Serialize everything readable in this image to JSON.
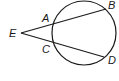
{
  "diagram": {
    "type": "geometry",
    "circle": {
      "cx": 84,
      "cy": 33,
      "r": 32
    },
    "points": {
      "E": {
        "label": "E",
        "x": 21,
        "y": 33,
        "label_x": 9,
        "label_y": 37
      },
      "A": {
        "label": "A",
        "x": 52,
        "y": 24,
        "label_x": 42,
        "label_y": 22
      },
      "B": {
        "label": "B",
        "x": 106,
        "y": 9,
        "label_x": 108,
        "label_y": 9
      },
      "C": {
        "label": "C",
        "x": 52,
        "y": 43,
        "label_x": 42,
        "label_y": 53
      },
      "D": {
        "label": "D",
        "x": 104,
        "y": 57,
        "label_x": 108,
        "label_y": 64
      }
    },
    "segments": [
      {
        "from": "E",
        "to": "B",
        "name": "secant-EB"
      },
      {
        "from": "E",
        "to": "D",
        "name": "secant-ED"
      }
    ]
  }
}
